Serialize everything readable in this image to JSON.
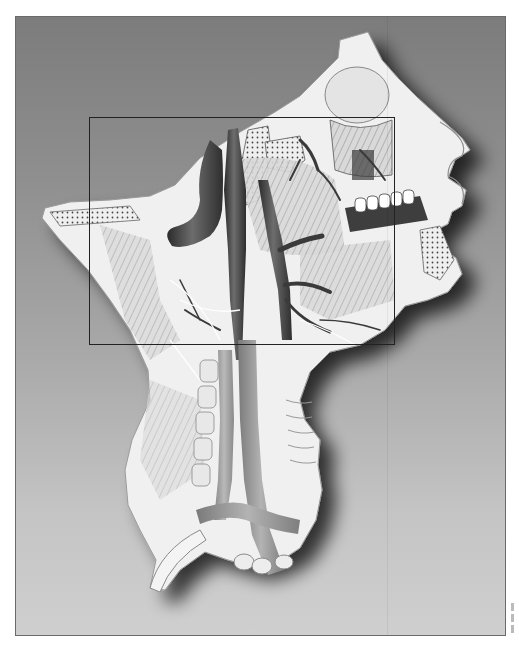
{
  "image": {
    "subject": "anatomical illustration — lateral dissection of head and neck showing carotid arteries and jugular vein",
    "palette": {
      "background_top": "#7c7c7c",
      "background_bottom": "#cfcfcf",
      "tissue": "#eeeeee",
      "vessel_dark": "#3a3a3a",
      "vessel_mid": "#6e6e6e",
      "frame_border": "#6a6a6a",
      "roi_border": "#222222"
    }
  },
  "overlay": {
    "roi_box": {
      "x": 89,
      "y": 117,
      "width": 306,
      "height": 228
    }
  }
}
